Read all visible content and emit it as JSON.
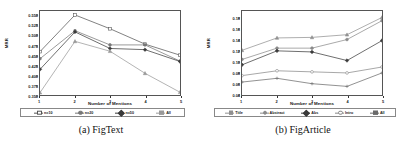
{
  "figure": {
    "panels": [
      {
        "id": "figtext",
        "caption": "(a) FigText",
        "ylabel": "MRR",
        "xlabel": "Number of Mentions"
      },
      {
        "id": "figarticle",
        "caption": "(b) FigArticle",
        "ylabel": "MRR",
        "xlabel": "Number of Mentions"
      }
    ]
  },
  "chart_data": [
    {
      "type": "line",
      "title": "(a) FigText",
      "xlabel": "Number of Mentions",
      "ylabel": "MRR",
      "x": [
        1,
        2,
        3,
        4,
        5
      ],
      "xticklabels": [
        "1",
        "2",
        "3",
        "4",
        "5"
      ],
      "yticklabels": [
        "0.350",
        "0.375",
        "0.400",
        "0.425",
        "0.450",
        "0.475",
        "0.500",
        "0.525",
        "0.550"
      ],
      "ylim": [
        0.345,
        0.558
      ],
      "xlim": [
        1,
        5
      ],
      "grid": false,
      "legend_position": "below-axes",
      "series": [
        {
          "name": "n=10",
          "marker": "square",
          "color": "#555555",
          "values": [
            0.455,
            0.548,
            0.513,
            0.474,
            0.446
          ]
        },
        {
          "name": "n=20",
          "marker": "circle",
          "color": "#777777",
          "values": [
            0.437,
            0.508,
            0.472,
            0.472,
            0.431
          ]
        },
        {
          "name": "n=50",
          "marker": "diamond",
          "color": "#3a3a3a",
          "values": [
            0.41,
            0.505,
            0.463,
            0.46,
            0.43
          ]
        },
        {
          "name": "All",
          "marker": "triangle",
          "color": "#999999",
          "values": [
            0.351,
            0.481,
            0.456,
            0.4,
            0.352
          ]
        }
      ]
    },
    {
      "type": "line",
      "title": "(b) FigArticle",
      "xlabel": "Number of Mentions",
      "ylabel": "MRR",
      "x": [
        1,
        2,
        3,
        4,
        5
      ],
      "xticklabels": [
        "1",
        "2",
        "3",
        "4",
        "5"
      ],
      "yticklabels": [
        "0.04",
        "0.06",
        "0.08",
        "0.10",
        "0.12",
        "0.14",
        "0.16",
        "0.18"
      ],
      "ylim": [
        0.034,
        0.19
      ],
      "xlim": [
        1,
        5
      ],
      "grid": false,
      "legend_position": "below-axes",
      "series": [
        {
          "name": "Title",
          "marker": "triangle",
          "color": "#909090",
          "values": [
            0.117,
            0.14,
            0.141,
            0.146,
            0.178
          ]
        },
        {
          "name": "Abstract",
          "marker": "circle",
          "color": "#8a8a8a",
          "values": [
            0.1,
            0.121,
            0.121,
            0.137,
            0.172
          ]
        },
        {
          "name": "Abs",
          "marker": "diamond",
          "color": "#3a3a3a",
          "values": [
            0.09,
            0.116,
            0.114,
            0.098,
            0.135
          ]
        },
        {
          "name": "Intro",
          "marker": "circle-open",
          "color": "#888888",
          "values": [
            0.07,
            0.079,
            0.077,
            0.075,
            0.086
          ]
        },
        {
          "name": "All",
          "marker": "plus",
          "color": "#6a6a6a",
          "values": [
            0.058,
            0.065,
            0.055,
            0.05,
            0.075
          ]
        }
      ]
    }
  ]
}
